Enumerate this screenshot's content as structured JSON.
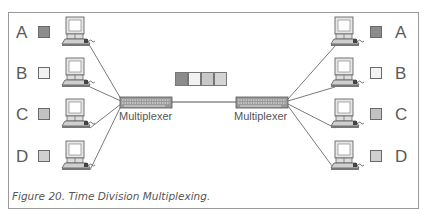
{
  "figure": {
    "caption": "Figure 20.  Time Division Multiplexing.",
    "left_stations": [
      {
        "label": "A",
        "color": "#8c8c8c"
      },
      {
        "label": "B",
        "color": "#f2f2f2"
      },
      {
        "label": "C",
        "color": "#c2c2c2"
      },
      {
        "label": "D",
        "color": "#d0d0d0"
      }
    ],
    "right_stations": [
      {
        "label": "A",
        "color": "#8c8c8c"
      },
      {
        "label": "B",
        "color": "#f2f2f2"
      },
      {
        "label": "C",
        "color": "#c2c2c2"
      },
      {
        "label": "D",
        "color": "#d0d0d0"
      }
    ],
    "left_mux_label": "Multiplexer",
    "right_mux_label": "Multiplexer",
    "frame_slots": [
      {
        "source": "A",
        "color": "#8c8c8c"
      },
      {
        "source": "B",
        "color": "#f2f2f2"
      },
      {
        "source": "C",
        "color": "#c8c8c8"
      },
      {
        "source": "D",
        "color": "#d4d4d4"
      }
    ],
    "icons": {
      "station": "computer-icon",
      "mux": "multiplexer-device-icon"
    }
  }
}
